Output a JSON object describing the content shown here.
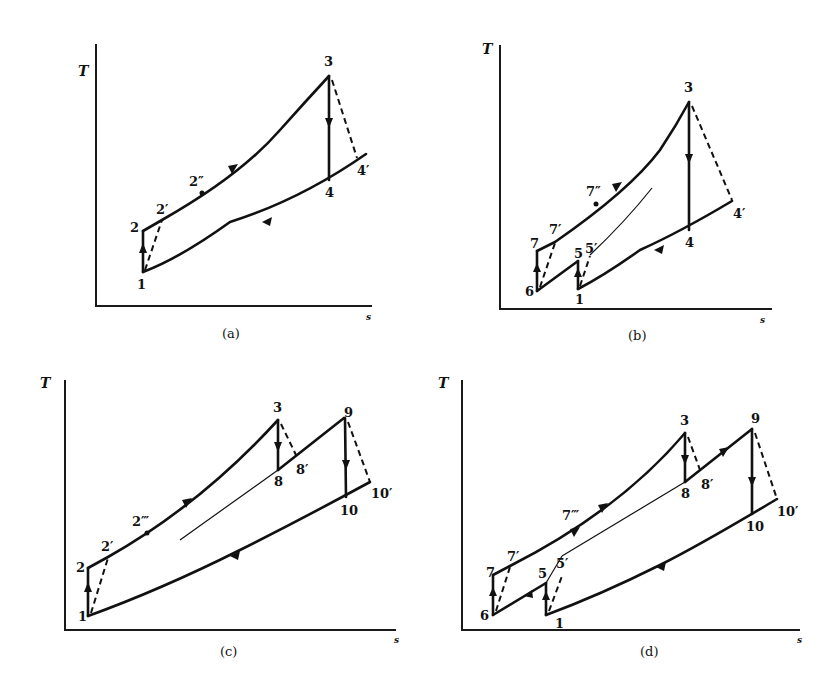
{
  "figure": {
    "axis_labels": {
      "y": "T",
      "x": "s"
    },
    "panels": [
      {
        "id": "a",
        "caption": "(a)",
        "points": [
          "1",
          "2",
          "2'",
          "2''",
          "3",
          "4",
          "4'"
        ]
      },
      {
        "id": "b",
        "caption": "(b)",
        "points": [
          "1",
          "5",
          "5'",
          "6",
          "7",
          "7'",
          "7''",
          "3",
          "4",
          "4'"
        ]
      },
      {
        "id": "c",
        "caption": "(c)",
        "points": [
          "1",
          "2",
          "2'",
          "2'''",
          "3",
          "8",
          "8'",
          "9",
          "10",
          "10'"
        ]
      },
      {
        "id": "d",
        "caption": "(d)",
        "points": [
          "1",
          "5",
          "5'",
          "6",
          "7",
          "7'",
          "7'''",
          "3",
          "8",
          "8'",
          "9",
          "10",
          "10'"
        ]
      }
    ]
  },
  "labels": {
    "a": {
      "T": "T",
      "s": "s",
      "caption": "(a)",
      "p1": "1",
      "p2": "2",
      "p2p": "2′",
      "p2pp": "2″",
      "p3": "3",
      "p4": "4",
      "p4p": "4′"
    },
    "b": {
      "T": "T",
      "s": "s",
      "caption": "(b)",
      "p1": "1",
      "p5": "5",
      "p5p": "5′",
      "p6": "6",
      "p7": "7",
      "p7p": "7′",
      "p7pp": "7″",
      "p3": "3",
      "p4": "4",
      "p4p": "4′"
    },
    "c": {
      "T": "T",
      "s": "s",
      "caption": "(c)",
      "p1": "1",
      "p2": "2",
      "p2p": "2′",
      "p2ppp": "2‴",
      "p3": "3",
      "p8": "8",
      "p8p": "8′",
      "p9": "9",
      "p10": "10",
      "p10p": "10′"
    },
    "d": {
      "T": "T",
      "s": "s",
      "caption": "(d)",
      "p1": "1",
      "p5": "5",
      "p5p": "5′",
      "p6": "6",
      "p7": "7",
      "p7p": "7′",
      "p7ppp": "7‴",
      "p3": "3",
      "p8": "8",
      "p8p": "8′",
      "p9": "9",
      "p10": "10",
      "p10p": "10′"
    }
  }
}
